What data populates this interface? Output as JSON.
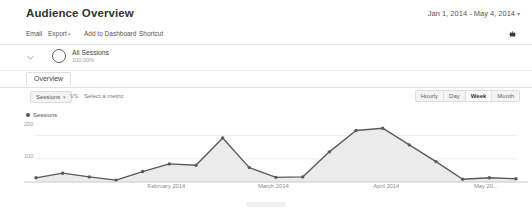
{
  "header": {
    "title": "Audience Overview",
    "date_range": "Jan 1, 2014 - May 4, 2014",
    "caret": "▾"
  },
  "action_bar": {
    "email": "Email",
    "export": "Export",
    "export_caret": "▾",
    "add_to_dashboard": "Add to Dashboard",
    "shortcut": "Shortcut",
    "icon": "share-icon"
  },
  "segment": {
    "chevron_icon": "chevron-down-icon",
    "circle_icon": "segment-circle-icon",
    "name": "All Sessions",
    "percent": "100.00%"
  },
  "tabs": {
    "overview": "Overview"
  },
  "metric_row": {
    "primary_metric": "Sessions",
    "caret": "▾",
    "vs": "VS.",
    "secondary_metric": "Select a metric",
    "granularity": [
      {
        "label": "Hourly",
        "active": false
      },
      {
        "label": "Day",
        "active": false
      },
      {
        "label": "Week",
        "active": true
      },
      {
        "label": "Month",
        "active": false
      }
    ]
  },
  "legend": {
    "series_label": "Sessions"
  },
  "chart_data": {
    "type": "area",
    "title": "Sessions",
    "xlabel": "",
    "ylabel": "Sessions",
    "ylim": [
      0,
      250
    ],
    "grid": true,
    "legend_position": "top-left",
    "line_color": "#5a5a5a",
    "fill_color": "#ebebeb",
    "y_ticks": [
      100,
      200
    ],
    "y_tick_labels": [
      "100",
      "200"
    ],
    "x_tick_labels": [
      "February 2014",
      "March 2014",
      "April 2014",
      "May 20..."
    ],
    "x_tick_positions": [
      0.27,
      0.5,
      0.74,
      0.95
    ],
    "categories": [
      "Jan 1",
      "Jan 5",
      "Jan 12",
      "Jan 19",
      "Jan 26",
      "Feb 2",
      "Feb 9",
      "Feb 16",
      "Feb 23",
      "Mar 2",
      "Mar 9",
      "Mar 16",
      "Mar 23",
      "Mar 30",
      "Apr 6",
      "Apr 13",
      "Apr 20",
      "Apr 27",
      "May 4"
    ],
    "values": [
      18,
      38,
      22,
      8,
      45,
      78,
      72,
      190,
      62,
      20,
      22,
      130,
      222,
      232,
      160,
      88,
      12,
      18,
      14
    ]
  }
}
